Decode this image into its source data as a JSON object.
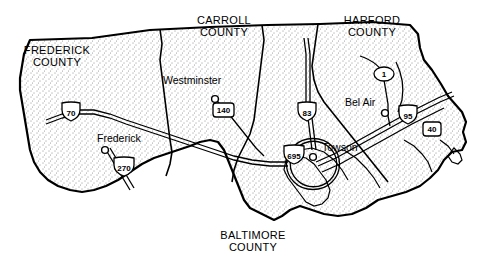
{
  "map": {
    "title_region": "Baltimore metropolitan area, Maryland",
    "counties": [
      {
        "name": "FREDERICK\nCOUNTY",
        "line1": "FREDERICK",
        "line2": "COUNTY",
        "x": 14,
        "y": 44
      },
      {
        "name": "CARROLL\nCOUNTY",
        "line1": "CARROLL",
        "line2": "COUNTY",
        "x": 181,
        "y": 14
      },
      {
        "name": "HARFORD\nCOUNTY",
        "line1": "HARFORD",
        "line2": "COUNTY",
        "x": 329,
        "y": 14
      },
      {
        "name": "BALTIMORE\nCOUNTY",
        "line1": "BALTIMORE",
        "line2": "COUNTY",
        "x": 252,
        "y": 229
      }
    ],
    "cities": [
      {
        "label": "Westminster",
        "x": 163,
        "y": 74,
        "dot_x": 215,
        "dot_y": 99
      },
      {
        "label": "Frederick",
        "x": 97,
        "y": 132,
        "dot_x": 105,
        "dot_y": 150
      },
      {
        "label": "Bel Air",
        "x": 345,
        "y": 96,
        "dot_x": 385,
        "dot_y": 113
      },
      {
        "label": "Towson",
        "x": 322,
        "y": 141,
        "dot_x": 313,
        "dot_y": 157
      }
    ],
    "route_shields": [
      {
        "type": "interstate",
        "number": "70",
        "x": 71,
        "y": 110
      },
      {
        "type": "interstate",
        "number": "270",
        "x": 124,
        "y": 165
      },
      {
        "type": "interstate",
        "number": "83",
        "x": 307,
        "y": 110
      },
      {
        "type": "interstate",
        "number": "695",
        "x": 294,
        "y": 153
      },
      {
        "type": "interstate",
        "number": "95",
        "x": 408,
        "y": 113
      },
      {
        "type": "us",
        "number": "140",
        "x": 223,
        "y": 110
      },
      {
        "type": "us",
        "number": "40",
        "x": 431,
        "y": 129
      },
      {
        "type": "state",
        "number": "1",
        "x": 384,
        "y": 74
      }
    ]
  }
}
